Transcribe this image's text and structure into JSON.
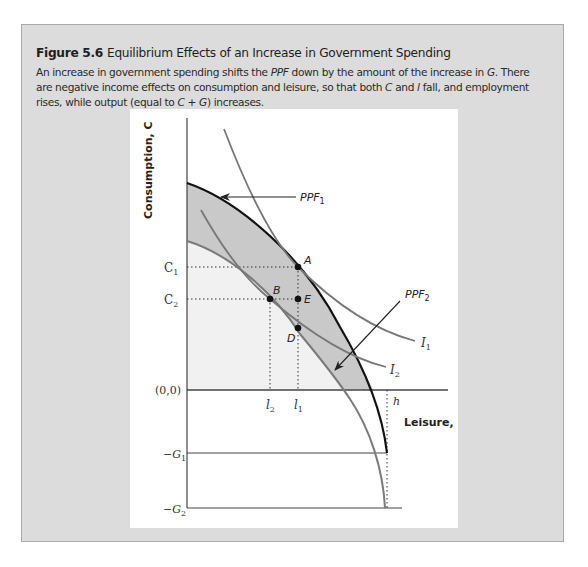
{
  "figure": {
    "number": "Figure 5.6",
    "title": "Equilibrium Effects of an Increase in Government Spending",
    "caption_parts": [
      {
        "text": "An increase in government spending shifts the ",
        "italic": false
      },
      {
        "text": "PPF",
        "italic": true
      },
      {
        "text": " down by the amount of the increase in ",
        "italic": false
      },
      {
        "text": "G",
        "italic": true
      },
      {
        "text": ". There are negative income effects on consumption and leisure, so that both ",
        "italic": false
      },
      {
        "text": "C",
        "italic": true
      },
      {
        "text": " and ",
        "italic": false
      },
      {
        "text": "l",
        "italic": true
      },
      {
        "text": " fall, and employment rises, while output (equal to ",
        "italic": false
      },
      {
        "text": "C + G",
        "italic": true
      },
      {
        "text": ") increases.",
        "italic": false
      }
    ]
  },
  "colors": {
    "card_bg": "#dcdcdc",
    "card_border": "#a9a9a9",
    "panel_bg": "#ffffff",
    "ppf1": "#111111",
    "ppf2_curves": "#777777",
    "band_fill": "#c9c9c9",
    "inner_fill": "#f1f1f1"
  },
  "chart_data": {
    "type": "line",
    "title": "Equilibrium Effects of an Increase in Government Spending",
    "xlabel": "Leisure, l",
    "ylabel": "Consumption, C",
    "grid": false,
    "legend": "none (curves labeled directly)",
    "y_tick_labels": [
      "C1",
      "C2",
      "(0,0)",
      "-G1",
      "-G2"
    ],
    "x_tick_labels": [
      "l2",
      "l1",
      "h"
    ],
    "series": [
      {
        "name": "PPF1",
        "description": "Original production possibilities frontier, concave, ending at (h, -G1)"
      },
      {
        "name": "PPF2",
        "description": "PPF shifted down by the increase in G, ending at (h, -G2)"
      },
      {
        "name": "I1",
        "description": "Indifference curve tangent to PPF1 at A"
      },
      {
        "name": "I2",
        "description": "Indifference curve tangent to PPF2 at B"
      }
    ],
    "points": [
      {
        "label": "A",
        "x": "l1",
        "y": "C1",
        "note": "initial equilibrium on PPF1 and I1"
      },
      {
        "label": "B",
        "x": "l2",
        "y": "C2",
        "note": "new equilibrium on PPF2 and I2"
      },
      {
        "label": "E",
        "x": "l1",
        "y": "C2"
      },
      {
        "label": "D",
        "x": "l1",
        "y": "below C2 on PPF2"
      }
    ],
    "annotations": [
      "PPF1 (arrow pointing to black curve)",
      "PPF2 (arrow pointing to gray curve)",
      "I1",
      "I2"
    ]
  },
  "labels": {
    "y_axis": "Consumption, C",
    "x_axis": "Leisure, l",
    "c1_main": "C",
    "c1_sub": "1",
    "c2_main": "C",
    "c2_sub": "2",
    "origin": "(0,0)",
    "g1_main": "−G",
    "g1_sub": "1",
    "g2_main": "−G",
    "g2_sub": "2",
    "l2_main": "l",
    "l2_sub": "2",
    "l1_main": "l",
    "l1_sub": "1",
    "h": "h",
    "ppf1_main": "PPF",
    "ppf1_sub": "1",
    "ppf2_main": "PPF",
    "ppf2_sub": "2",
    "i1_main": "I",
    "i1_sub": "1",
    "i2_main": "I",
    "i2_sub": "2",
    "point_a": "A",
    "point_b": "B",
    "point_d": "D",
    "point_e": "E"
  }
}
